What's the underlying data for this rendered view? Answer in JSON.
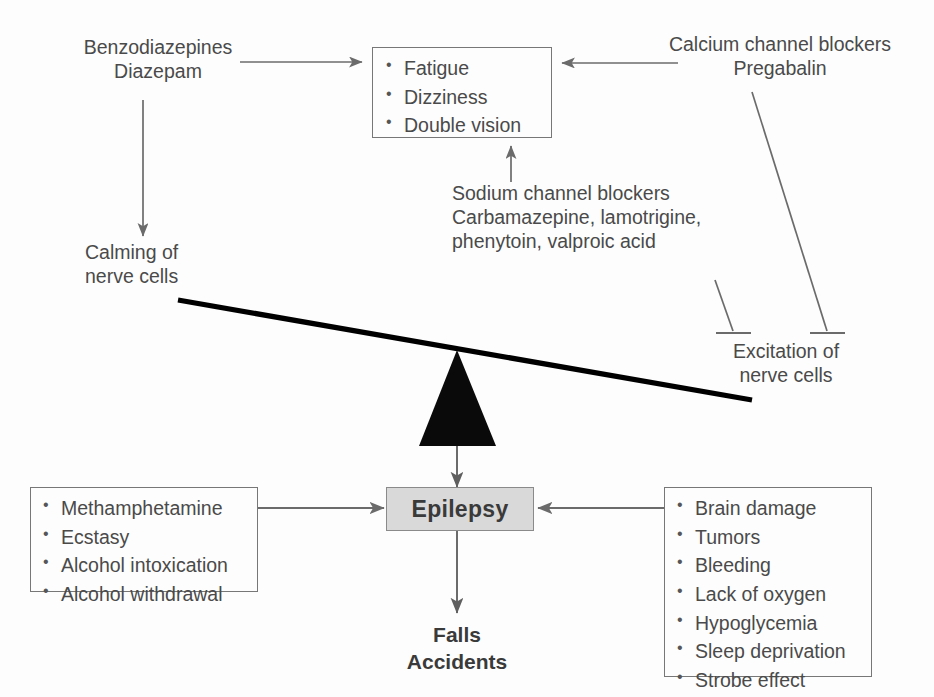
{
  "diagram": {
    "title_present": false,
    "colors": {
      "text": "#4a4a4a",
      "line": "#6b6b6b",
      "box_border": "#777777",
      "lever": "#000000",
      "epilepsy_fill": "#d9d9d9",
      "epilepsy_border": "#8a8a8a",
      "background": "#fdfdfd"
    },
    "nodes": {
      "benzodiazepines": {
        "class_label": "Benzodiazepines",
        "drug_label": "Diazepam"
      },
      "calcium_blockers": {
        "class_label": "Calcium channel blockers",
        "drug_label": "Pregabalin"
      },
      "sodium_blockers": {
        "class_label": "Sodium channel blockers",
        "drug_line_1": "Carbamazepine, lamotrigine,",
        "drug_line_2": "phenytoin, valproic acid"
      },
      "side_effects": {
        "items": [
          "Fatigue",
          "Dizziness",
          "Double vision"
        ]
      },
      "calming": {
        "line_1": "Calming of",
        "line_2": "nerve cells"
      },
      "excitation": {
        "line_1": "Excitation of",
        "line_2": "nerve cells"
      },
      "epilepsy": {
        "label": "Epilepsy"
      },
      "triggers_left": {
        "items": [
          "Methamphetamine",
          "Ecstasy",
          "Alcohol intoxication",
          "Alcohol withdrawal"
        ]
      },
      "causes_right": {
        "items": [
          "Brain damage",
          "Tumors",
          "Bleeding",
          "Lack of oxygen",
          "Hypoglycemia",
          "Sleep deprivation",
          "Strobe effect"
        ]
      },
      "outcomes": {
        "line_1": "Falls",
        "line_2": "Accidents"
      }
    },
    "connectors": [
      {
        "name": "benzodiazepines-to-side-effects",
        "kind": "arrow",
        "from": "benzodiazepines",
        "to": "side_effects"
      },
      {
        "name": "calcium-blockers-to-side-effects",
        "kind": "arrow",
        "from": "calcium_blockers",
        "to": "side_effects"
      },
      {
        "name": "sodium-blockers-to-side-effects",
        "kind": "arrow",
        "from": "sodium_blockers",
        "to": "side_effects"
      },
      {
        "name": "diazepam-to-calming",
        "kind": "arrow",
        "from": "benzodiazepines",
        "to": "calming"
      },
      {
        "name": "pregabalin-inhibits-excitation",
        "kind": "inhibition",
        "from": "calcium_blockers",
        "to": "excitation"
      },
      {
        "name": "sodium-blockers-inhibit-excitation",
        "kind": "inhibition",
        "from": "sodium_blockers",
        "to": "excitation"
      },
      {
        "name": "triggers-left-to-epilepsy",
        "kind": "arrow",
        "from": "triggers_left",
        "to": "epilepsy"
      },
      {
        "name": "causes-right-to-epilepsy",
        "kind": "arrow",
        "from": "causes_right",
        "to": "epilepsy"
      },
      {
        "name": "balance-to-epilepsy",
        "kind": "arrow",
        "from": "balance_fulcrum",
        "to": "epilepsy"
      },
      {
        "name": "epilepsy-to-outcomes",
        "kind": "arrow",
        "from": "epilepsy",
        "to": "outcomes"
      }
    ],
    "balance": {
      "description": "seesaw tilted down toward excitation side",
      "beam_left_end": [
        178,
        300
      ],
      "beam_right_end": [
        752,
        400
      ],
      "fulcrum_apex": [
        457,
        350
      ],
      "fulcrum_base": [
        420,
        446,
        495,
        446
      ]
    }
  }
}
